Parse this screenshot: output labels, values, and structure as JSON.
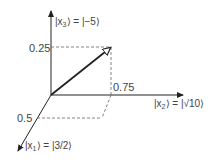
{
  "diagram": {
    "axes": {
      "x1": {
        "label_prefix": "|x",
        "sub": "1",
        "label_suffix": "⟩ = |3/2⟩"
      },
      "x2": {
        "label_prefix": "|x",
        "sub": "2",
        "label_suffix": "⟩ = |√10⟩"
      },
      "x3": {
        "label_prefix": "|x",
        "sub": "3",
        "label_suffix": "⟩ = |−5⟩"
      }
    },
    "ticks": {
      "x3_value": "0.25",
      "x2_value": "0.75",
      "x1_value": "0.5"
    },
    "colors": {
      "axis": "#222222",
      "dashed": "#666666",
      "text": "#444444"
    }
  }
}
